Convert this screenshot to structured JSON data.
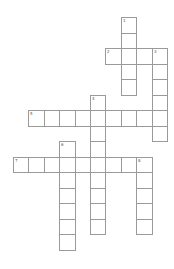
{
  "puzzle": {
    "type": "crossword",
    "origin": {
      "x": 13,
      "y": 17
    },
    "cell_w": 15.4,
    "cell_h": 15.5,
    "line_color": "#9a9a9a",
    "entries": [
      {
        "number": "1",
        "direction": "down",
        "row": 0,
        "col": 7,
        "length": 5
      },
      {
        "number": "2",
        "direction": "across",
        "row": 2,
        "col": 6,
        "length": 4
      },
      {
        "number": "3",
        "direction": "down",
        "row": 2,
        "col": 9,
        "length": 6
      },
      {
        "number": "4",
        "direction": "down",
        "row": 5,
        "col": 5,
        "length": 9
      },
      {
        "number": "5",
        "direction": "across",
        "row": 6,
        "col": 1,
        "length": 9
      },
      {
        "number": "6",
        "direction": "down",
        "row": 8,
        "col": 3,
        "length": 7
      },
      {
        "number": "7",
        "direction": "across",
        "row": 9,
        "col": 0,
        "length": 9
      },
      {
        "number": "8",
        "direction": "down",
        "row": 9,
        "col": 8,
        "length": 5
      }
    ]
  }
}
